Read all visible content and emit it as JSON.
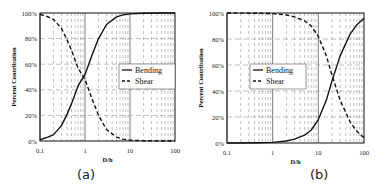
{
  "chart_data": [
    {
      "type": "line",
      "panel_label": "(a)",
      "xlabel": "D/h",
      "ylabel": "Percent Contribution",
      "xscale": "log",
      "xlim": [
        0.1,
        100
      ],
      "ylim": [
        0,
        100
      ],
      "x_ticks": [
        "0.1",
        "1",
        "10",
        "100"
      ],
      "y_ticks": [
        "0%",
        "20%",
        "40%",
        "60%",
        "80%",
        "100%"
      ],
      "grid": true,
      "legend": {
        "position": "right-middle",
        "entries": [
          "Bending",
          "Shear"
        ]
      },
      "x": [
        0.1,
        0.15,
        0.2,
        0.3,
        0.4,
        0.5,
        0.7,
        1,
        1.5,
        2,
        3,
        5,
        7,
        10,
        20,
        50,
        100
      ],
      "series": [
        {
          "name": "Bending",
          "style": "solid",
          "values": [
            1,
            3,
            5,
            12,
            21,
            29,
            43,
            52,
            69,
            80,
            91,
            97,
            98.5,
            99.3,
            99.8,
            100,
            100
          ]
        },
        {
          "name": "Shear",
          "style": "dashed",
          "values": [
            99,
            97,
            95,
            88,
            79,
            71,
            57,
            48,
            31,
            20,
            9,
            3,
            1.5,
            0.7,
            0.2,
            0,
            0
          ]
        }
      ]
    },
    {
      "type": "line",
      "panel_label": "(b)",
      "xlabel": "D/h",
      "ylabel": "Percent Contribution",
      "xscale": "log",
      "xlim": [
        0.1,
        100
      ],
      "ylim": [
        0,
        100
      ],
      "x_ticks": [
        "0.1",
        "1",
        "10",
        "100"
      ],
      "y_ticks": [
        "0%",
        "20%",
        "40%",
        "60%",
        "80%",
        "100%"
      ],
      "grid": true,
      "legend": {
        "position": "left-middle",
        "entries": [
          "Bending",
          "Shear"
        ]
      },
      "x": [
        0.1,
        0.5,
        1,
        2,
        3,
        5,
        7,
        10,
        15,
        20,
        30,
        50,
        70,
        100
      ],
      "series": [
        {
          "name": "Bending",
          "style": "solid",
          "values": [
            0,
            0.2,
            0.5,
            1.5,
            3,
            6,
            10,
            18,
            33,
            48,
            67,
            84,
            91,
            96
          ]
        },
        {
          "name": "Shear",
          "style": "dashed",
          "values": [
            100,
            99.8,
            99.5,
            98.5,
            97,
            94,
            90,
            82,
            67,
            52,
            33,
            16,
            9,
            4
          ]
        }
      ]
    }
  ],
  "panels": [
    {
      "caption": "(a)",
      "xlabel": "D/h",
      "ylabel": "Percent Contribution",
      "legend": [
        "Bending",
        "Shear"
      ]
    },
    {
      "caption": "(b)",
      "xlabel": "D/h",
      "ylabel": "Percent Contribution",
      "legend": [
        "Bending",
        "Shear"
      ]
    }
  ]
}
